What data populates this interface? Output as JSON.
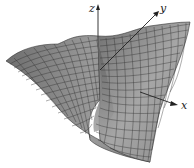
{
  "figure": {
    "type": "3d-surface-plot",
    "axes": {
      "z": {
        "label": "z"
      },
      "y": {
        "label": "y"
      },
      "x": {
        "label": "x"
      }
    },
    "colors": {
      "surface_fill": "#8c8c8c",
      "surface_dark": "#5a5a5a",
      "surface_light": "#b4b4b4",
      "mesh_line": "#2a2a2a",
      "axis": "#222222",
      "background": "#ffffff"
    }
  }
}
